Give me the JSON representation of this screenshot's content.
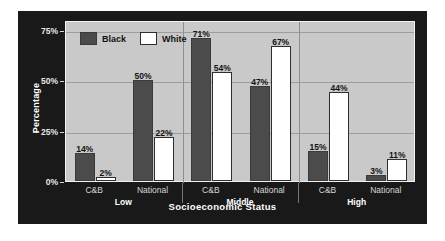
{
  "chart_data": {
    "type": "bar",
    "title": "",
    "xlabel": "Socioeconomic Status",
    "ylabel": "Percentage",
    "ylim": [
      0,
      80
    ],
    "grid": true,
    "legend_position": "top-left",
    "y_ticks": [
      "0%",
      "25%",
      "50%",
      "75%"
    ],
    "y_tick_values": [
      0,
      25,
      50,
      75
    ],
    "groups": [
      {
        "name": "Low",
        "categories": [
          "C&B",
          "National"
        ],
        "bars": [
          {
            "category": "C&B",
            "series": "Black",
            "value": 14,
            "label": "14%"
          },
          {
            "category": "C&B",
            "series": "White",
            "value": 2,
            "label": "2%"
          },
          {
            "category": "National",
            "series": "Black",
            "value": 50,
            "label": "50%"
          },
          {
            "category": "National",
            "series": "White",
            "value": 22,
            "label": "22%"
          }
        ]
      },
      {
        "name": "Middle",
        "categories": [
          "C&B",
          "National"
        ],
        "bars": [
          {
            "category": "C&B",
            "series": "Black",
            "value": 71,
            "label": "71%"
          },
          {
            "category": "C&B",
            "series": "White",
            "value": 54,
            "label": "54%"
          },
          {
            "category": "National",
            "series": "Black",
            "value": 47,
            "label": "47%"
          },
          {
            "category": "National",
            "series": "White",
            "value": 67,
            "label": "67%"
          }
        ]
      },
      {
        "name": "High",
        "categories": [
          "C&B",
          "National"
        ],
        "bars": [
          {
            "category": "C&B",
            "series": "Black",
            "value": 15,
            "label": "15%"
          },
          {
            "category": "C&B",
            "series": "White",
            "value": 44,
            "label": "44%"
          },
          {
            "category": "National",
            "series": "Black",
            "value": 3,
            "label": "3%"
          },
          {
            "category": "National",
            "series": "White",
            "value": 11,
            "label": "11%"
          }
        ]
      }
    ],
    "series": [
      {
        "name": "Black",
        "color": "#4b4b4b",
        "values": [
          14,
          50,
          71,
          47,
          15,
          3
        ]
      },
      {
        "name": "White",
        "color": "#ffffff",
        "values": [
          2,
          22,
          54,
          67,
          44,
          11
        ]
      }
    ],
    "legend": [
      {
        "label": "Black",
        "swatch": "black"
      },
      {
        "label": "White",
        "swatch": "white"
      }
    ]
  }
}
